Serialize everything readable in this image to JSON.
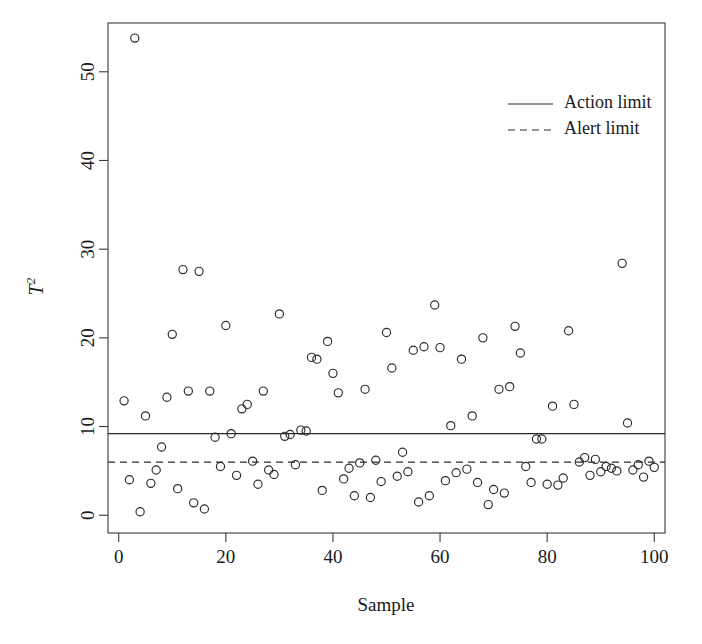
{
  "chart_data": {
    "type": "scatter",
    "title": "",
    "xlabel": "Sample",
    "ylabel": "T²",
    "ylabel_base": "T",
    "ylabel_exponent": "2",
    "xlim": [
      -2,
      102
    ],
    "ylim": [
      -2,
      55.5
    ],
    "xticks": [
      0,
      20,
      40,
      60,
      80,
      100
    ],
    "yticks": [
      0,
      10,
      20,
      30,
      40,
      50
    ],
    "xticklabels": [
      "0",
      "20",
      "40",
      "60",
      "80",
      "100"
    ],
    "yticklabels": [
      "0",
      "10",
      "20",
      "30",
      "40",
      "50"
    ],
    "grid": false,
    "legend_position": "top-right",
    "marker": "open-circle",
    "series": [
      {
        "name": "T2 statistic",
        "x": [
          1,
          2,
          3,
          4,
          5,
          6,
          7,
          8,
          9,
          10,
          11,
          12,
          13,
          14,
          15,
          16,
          17,
          18,
          19,
          20,
          21,
          22,
          23,
          24,
          25,
          26,
          27,
          28,
          29,
          30,
          31,
          32,
          33,
          34,
          35,
          36,
          37,
          38,
          39,
          40,
          41,
          42,
          43,
          44,
          45,
          46,
          47,
          48,
          49,
          50,
          51,
          52,
          53,
          54,
          55,
          56,
          57,
          58,
          59,
          60,
          61,
          62,
          63,
          64,
          65,
          66,
          67,
          68,
          69,
          70,
          71,
          72,
          73,
          74,
          75,
          76,
          77,
          78,
          79,
          80,
          81,
          82,
          83,
          84,
          85,
          86,
          87,
          88,
          89,
          90,
          91,
          92,
          93,
          94,
          95,
          96,
          97,
          98,
          99,
          100
        ],
        "y": [
          12.9,
          4.0,
          53.8,
          0.4,
          11.2,
          3.6,
          5.1,
          7.7,
          13.3,
          20.4,
          3.0,
          27.7,
          14.0,
          1.4,
          27.5,
          0.7,
          14.0,
          8.8,
          5.5,
          21.4,
          9.2,
          4.5,
          12.0,
          12.5,
          6.1,
          3.5,
          14.0,
          5.1,
          4.6,
          22.7,
          8.9,
          9.1,
          5.7,
          9.6,
          9.5,
          17.8,
          17.6,
          2.8,
          19.6,
          16.0,
          13.8,
          4.1,
          5.3,
          2.2,
          5.9,
          14.2,
          2.0,
          6.2,
          3.8,
          20.6,
          16.6,
          4.4,
          7.1,
          4.9,
          18.6,
          1.5,
          19.0,
          2.2,
          23.7,
          18.9,
          3.9,
          10.1,
          4.8,
          17.6,
          5.2,
          11.2,
          3.7,
          20.0,
          1.2,
          2.9,
          14.2,
          2.5,
          14.5,
          21.3,
          18.3,
          5.5,
          3.7,
          8.6,
          8.6,
          3.5,
          12.3,
          3.4,
          4.2,
          20.8,
          12.5,
          6.0,
          6.5,
          4.5,
          6.3,
          4.9,
          5.5,
          5.3,
          5.0,
          28.4,
          10.4,
          5.1,
          5.7,
          4.3,
          6.1,
          5.4
        ]
      }
    ],
    "reference_lines": [
      {
        "label": "Action limit",
        "value": 9.2,
        "style": "solid"
      },
      {
        "label": "Alert limit",
        "value": 6.0,
        "style": "dashed"
      }
    ],
    "legend": [
      {
        "label": "Action limit",
        "style": "solid"
      },
      {
        "label": "Alert limit",
        "style": "dashed"
      }
    ],
    "colors": {
      "marker_stroke": "#2b2b2b",
      "axis": "#3a3a3a",
      "background": "#ffffff",
      "limit_line": "#2b2b2b"
    }
  }
}
